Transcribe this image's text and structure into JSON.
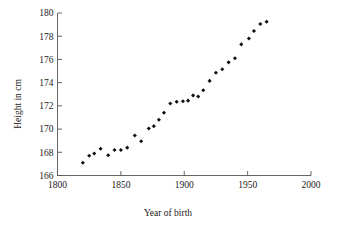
{
  "chart_data": {
    "type": "scatter",
    "title": "",
    "xlabel": "Year of birth",
    "ylabel": "Height in cm",
    "xlim": [
      1800,
      2000
    ],
    "ylim": [
      166,
      180
    ],
    "xticks": [
      1800,
      1850,
      1900,
      1950,
      2000
    ],
    "xticklabels": [
      "1800",
      "1850",
      "1900",
      "1950",
      "2000"
    ],
    "yticks": [
      166,
      168,
      170,
      172,
      174,
      176,
      178,
      180
    ],
    "yticklabels": [
      "166",
      "168",
      "170",
      "172",
      "174",
      "176",
      "178",
      "180"
    ],
    "grid": false,
    "legend": null,
    "marker": "filled-diamond",
    "marker_color": "#111111",
    "points": [
      {
        "x": 1820,
        "y": 167.1
      },
      {
        "x": 1825,
        "y": 167.7
      },
      {
        "x": 1829,
        "y": 167.9
      },
      {
        "x": 1834,
        "y": 168.3
      },
      {
        "x": 1840,
        "y": 167.75
      },
      {
        "x": 1845,
        "y": 168.2
      },
      {
        "x": 1850,
        "y": 168.2
      },
      {
        "x": 1855,
        "y": 168.4
      },
      {
        "x": 1861,
        "y": 169.45
      },
      {
        "x": 1866,
        "y": 168.95
      },
      {
        "x": 1872,
        "y": 170.05
      },
      {
        "x": 1876,
        "y": 170.25
      },
      {
        "x": 1880,
        "y": 170.8
      },
      {
        "x": 1884,
        "y": 171.4
      },
      {
        "x": 1889,
        "y": 172.2
      },
      {
        "x": 1894,
        "y": 172.35
      },
      {
        "x": 1899,
        "y": 172.4
      },
      {
        "x": 1903,
        "y": 172.45
      },
      {
        "x": 1907,
        "y": 172.9
      },
      {
        "x": 1911,
        "y": 172.8
      },
      {
        "x": 1915,
        "y": 173.35
      },
      {
        "x": 1920,
        "y": 174.15
      },
      {
        "x": 1925,
        "y": 174.85
      },
      {
        "x": 1930,
        "y": 175.15
      },
      {
        "x": 1935,
        "y": 175.75
      },
      {
        "x": 1940,
        "y": 176.1
      },
      {
        "x": 1945,
        "y": 177.3
      },
      {
        "x": 1951,
        "y": 177.8
      },
      {
        "x": 1955,
        "y": 178.45
      },
      {
        "x": 1960,
        "y": 179.05
      },
      {
        "x": 1965,
        "y": 179.25
      }
    ]
  },
  "axes": {
    "x_title": "Year of birth",
    "y_title": "Height in cm"
  }
}
